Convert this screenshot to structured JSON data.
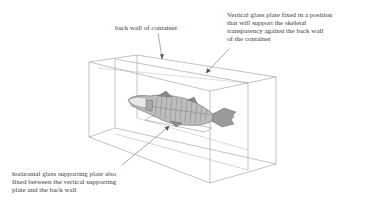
{
  "diagram": {
    "labels": {
      "back_wall": [
        "back wall of container"
      ],
      "vertical_plate": [
        "Vertical glass plate fixed in a position",
        "that will support the skeletal",
        "transparency against the back wall",
        "of the container"
      ],
      "horizontal_plate": [
        "horizontal glass supporting plate also",
        "fixed between the vertical supporting",
        "plate and the back wall"
      ]
    },
    "colors": {
      "line": "#8a8a8a",
      "text": "#3b3b3b",
      "fish": "#6e6e6e"
    }
  }
}
